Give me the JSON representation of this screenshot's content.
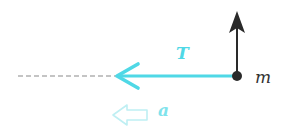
{
  "diagram": {
    "colors": {
      "tension": "#4fd8e6",
      "acceleration": "#bfeff3",
      "force_up": "#2a2a2a",
      "dashed_line": "#888888",
      "mass": "#2a2a2a",
      "label_m": "#333333"
    },
    "labels": {
      "tension": "T",
      "mass": "m",
      "acceleration": "a"
    },
    "elements": {
      "mass_point": {
        "x": 237,
        "y": 76,
        "r": 5
      },
      "tension_arrow": {
        "from": [
          237,
          76
        ],
        "to": [
          116,
          76
        ],
        "direction": "left"
      },
      "upward_arrow": {
        "from": [
          237,
          76
        ],
        "to": [
          237,
          12
        ],
        "direction": "up"
      },
      "dashed_extension": {
        "from": [
          18,
          76
        ],
        "to": [
          116,
          76
        ]
      },
      "acceleration_arrow": {
        "x": 112,
        "y": 115,
        "length": 36,
        "direction": "left",
        "style": "hollow"
      }
    }
  }
}
